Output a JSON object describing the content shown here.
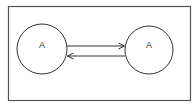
{
  "diagram": {
    "type": "state-diagram",
    "frame": {
      "x": 8,
      "y": 6,
      "width": 183,
      "height": 95,
      "stroke": "#555555"
    },
    "nodes": [
      {
        "id": "left",
        "label": "A",
        "cx": 42,
        "cy": 49,
        "r": 25
      },
      {
        "id": "right",
        "label": "A",
        "cx": 149,
        "cy": 50,
        "r": 24
      }
    ],
    "edges": [
      {
        "from": "left",
        "to": "right",
        "direction": "right",
        "y": 46
      },
      {
        "from": "right",
        "to": "left",
        "direction": "left",
        "y": 56
      }
    ],
    "colors": {
      "stroke": "#333333",
      "background": "#ffffff"
    }
  }
}
